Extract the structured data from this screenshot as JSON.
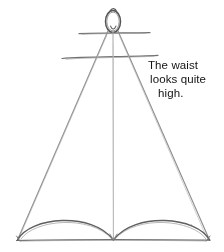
{
  "canvas": {
    "width": 224,
    "height": 252,
    "background_color": "#ffffff",
    "media": "pencil sketch"
  },
  "annotation": {
    "name": "waist-note",
    "full_text": "The waist looks quite high.",
    "lines": [
      "The waist",
      "looks quite",
      "high."
    ],
    "color": "#141414"
  },
  "sketch": {
    "title": "figure-croquis-sketch",
    "stroke_color": "#8a8a8a",
    "dark_stroke_color": "#6b6b6b",
    "parts": [
      {
        "name": "head-oval",
        "label": "head"
      },
      {
        "name": "shoulder-line",
        "label": "shoulders"
      },
      {
        "name": "waist-line",
        "label": "waist"
      },
      {
        "name": "center-front-line",
        "label": "center front"
      },
      {
        "name": "left-silhouette-line",
        "label": "left side seam"
      },
      {
        "name": "right-silhouette-line",
        "label": "right side seam"
      },
      {
        "name": "hem-baseline",
        "label": "hem baseline"
      },
      {
        "name": "left-hem-arc",
        "label": "left hem arc"
      },
      {
        "name": "right-hem-arc",
        "label": "right hem arc"
      }
    ]
  }
}
